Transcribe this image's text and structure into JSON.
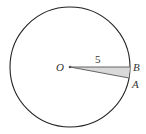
{
  "diagram": {
    "type": "circle-sector",
    "circle": {
      "cx": 70,
      "cy": 67,
      "r": 60,
      "stroke": "#222222"
    },
    "center": {
      "label": "O",
      "x": 70,
      "y": 67
    },
    "points": [
      {
        "label": "B",
        "x": 130,
        "y": 67
      },
      {
        "label": "A",
        "x": 129,
        "y": 78
      }
    ],
    "radius_label": "5",
    "sector_fill": "#d9d9d9"
  }
}
